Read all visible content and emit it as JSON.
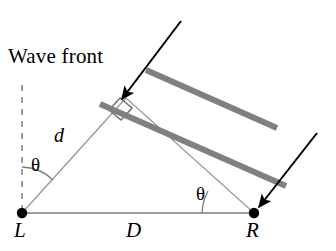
{
  "figure": {
    "width": 336,
    "height": 251,
    "background_color": "#ffffff"
  },
  "labels": {
    "wave_front": "Wave front",
    "path_difference": "d",
    "baseline": "D",
    "left_station": "L",
    "right_station": "R",
    "angle_left": "θ",
    "angle_right": "θ"
  },
  "colors": {
    "wavefront_bar": "#808080",
    "thin_line": "#7d7d7d",
    "arrow": "#000000",
    "point": "#000000",
    "dashed_line": "#888888",
    "text": "#000000"
  },
  "geometry": {
    "point_L": {
      "x": 22,
      "y": 213,
      "radius": 5
    },
    "point_R": {
      "x": 254,
      "y": 213,
      "radius": 5
    },
    "baseline": {
      "x1": 22,
      "y1": 213,
      "x2": 254,
      "y2": 213
    },
    "dashed_vertical": {
      "x1": 22,
      "y1": 85,
      "x2": 22,
      "y2": 213,
      "dash": "6 6"
    },
    "ray_d": {
      "x1": 22,
      "y1": 213,
      "x2": 125,
      "y2": 99
    },
    "right_angle_marker": {
      "x": 118,
      "y": 106,
      "size": 15
    },
    "wavefront_bar_near": {
      "x1": 100,
      "y1": 104,
      "x2": 285,
      "y2": 185,
      "width": 6
    },
    "wavefront_bar_far": {
      "x1": 145,
      "y1": 70,
      "x2": 276,
      "y2": 128
    },
    "arrow_left": {
      "x1": 180,
      "y1": 21,
      "x2": 120,
      "y2": 101
    },
    "arrow_right": {
      "x1": 316,
      "y1": 134,
      "x2": 258,
      "y2": 208
    },
    "angle_arc_left": {
      "center_x": 22,
      "center_y": 213,
      "radius": 46,
      "from_deg": -90,
      "to_deg": -48
    },
    "angle_arc_right": {
      "center_x": 254,
      "center_y": 213,
      "radius": 52,
      "from_deg": 180,
      "to_deg": 204
    }
  },
  "annotations": {
    "wavefront_count": 2,
    "arrow_count": 2,
    "theta_count": 2
  }
}
